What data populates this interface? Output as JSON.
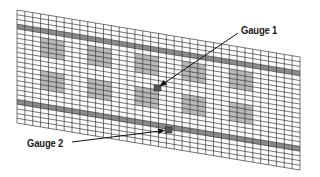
{
  "diagram": {
    "type": "finite-element mesh with strain gauge locations",
    "mesh": {
      "corners": {
        "top_left": [
          17,
          10
        ],
        "top_right": [
          300,
          57
        ],
        "bottom_right": [
          300,
          170
        ],
        "bottom_left": [
          17,
          123
        ]
      },
      "columns": 36,
      "rows": 24,
      "line_color": "#3a3a3a",
      "patch_color": "#b8b8b8",
      "band_color": "#8a8a8a",
      "bands": [
        {
          "name": "top-band",
          "row_start": 3,
          "row_end": 4
        },
        {
          "name": "bottom-band",
          "row_start": 19,
          "row_end": 20
        }
      ],
      "patch_rows": [
        {
          "row_start": 5,
          "row_end": 9
        },
        {
          "row_start": 12,
          "row_end": 16
        }
      ],
      "patch_columns": [
        {
          "col_start": 3,
          "col_end": 6
        },
        {
          "col_start": 9,
          "col_end": 12
        },
        {
          "col_start": 15,
          "col_end": 18
        },
        {
          "col_start": 21,
          "col_end": 24
        },
        {
          "col_start": 27,
          "col_end": 30
        }
      ]
    },
    "gauges": [
      {
        "id": "gauge-1",
        "label": "Gauge 1",
        "marker": [
          157,
          88
        ],
        "arrow_from": [
          238,
          33
        ],
        "color": "#555555"
      },
      {
        "id": "gauge-2",
        "label": "Gauge 2",
        "marker": [
          168,
          130
        ],
        "arrow_from": [
          72,
          142
        ],
        "color": "#555555"
      }
    ]
  }
}
